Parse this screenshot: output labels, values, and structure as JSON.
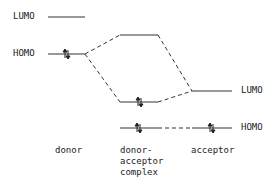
{
  "diagram": {
    "type": "molecular-orbital-energy-diagram",
    "columns": {
      "donor": "donor",
      "complex": "donor-\nacceptor\ncomplex",
      "acceptor": "acceptor"
    },
    "level_labels": {
      "donor_lumo": "LUMO",
      "donor_homo": "HOMO",
      "acceptor_lumo": "LUMO",
      "acceptor_homo": "HOMO"
    },
    "electron_pair_glyph": "⇅",
    "colors": {
      "line": "#333333",
      "text": "#222222",
      "background": "#ffffff"
    }
  }
}
